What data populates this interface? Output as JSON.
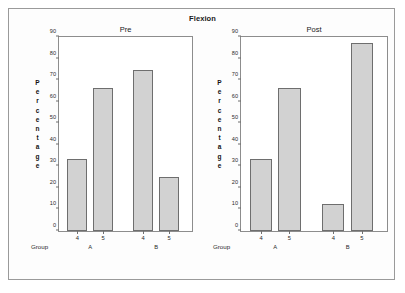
{
  "chart_data": {
    "type": "bar",
    "title": "Flexion",
    "xlabel": "Group",
    "ylabel": "Percentage",
    "ylim": [
      0,
      90
    ],
    "yticks": [
      0,
      10,
      20,
      30,
      40,
      50,
      60,
      70,
      80,
      90
    ],
    "grid": false,
    "legend": null,
    "bar_fill_color": "#d2d2d2",
    "bar_edge_color": "#6e6e6e",
    "panel_layout": "two horizontal panels",
    "categories": [
      "4",
      "5"
    ],
    "groups": [
      "A",
      "B"
    ],
    "panels": [
      {
        "label": "Pre",
        "bars": [
          {
            "group": "A",
            "category": "4",
            "value": 33.5
          },
          {
            "group": "A",
            "category": "5",
            "value": 66.3
          },
          {
            "group": "B",
            "category": "4",
            "value": 74.5
          },
          {
            "group": "B",
            "category": "5",
            "value": 25.0
          }
        ]
      },
      {
        "label": "Post",
        "bars": [
          {
            "group": "A",
            "category": "4",
            "value": 33.3
          },
          {
            "group": "A",
            "category": "5",
            "value": 66.3
          },
          {
            "group": "B",
            "category": "4",
            "value": 12.5
          },
          {
            "group": "B",
            "category": "5",
            "value": 87.0
          }
        ]
      }
    ]
  },
  "axis": {
    "y_title_letters": [
      "P",
      "e",
      "r",
      "c",
      "e",
      "n",
      "t",
      "a",
      "g",
      "e"
    ],
    "y_tick_labels": [
      "90",
      "80",
      "70",
      "60",
      "50",
      "40",
      "30",
      "20",
      "10",
      "0"
    ],
    "x_axis_caption": "Group"
  }
}
